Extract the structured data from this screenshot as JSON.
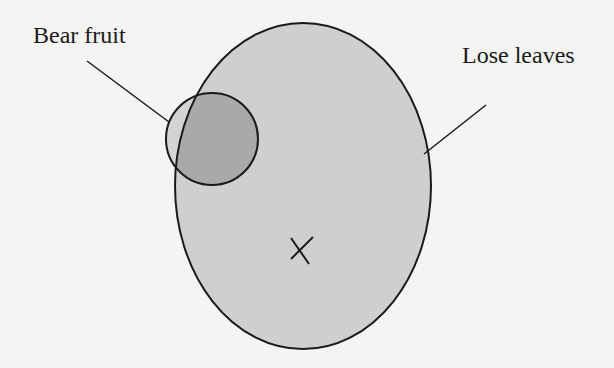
{
  "diagram": {
    "type": "venn",
    "sets": [
      {
        "id": "lose-leaves",
        "label": "Lose leaves",
        "shape": "ellipse",
        "fill": "#cfcfcd"
      },
      {
        "id": "bear-fruit",
        "label": "Bear fruit",
        "shape": "circle",
        "fill": "#a9a9a7"
      }
    ],
    "marker": {
      "symbol": "×",
      "region": "lose-leaves-only"
    },
    "colors": {
      "background": "#f4f4f2",
      "stroke": "#1a1a1a",
      "ellipse_fill": "#cfcfcd",
      "circle_fill": "#a9a9a7",
      "circle_outside_fill": "#d4d4d2"
    }
  },
  "labels": {
    "bear_fruit": "Bear fruit",
    "lose_leaves": "Lose leaves"
  }
}
